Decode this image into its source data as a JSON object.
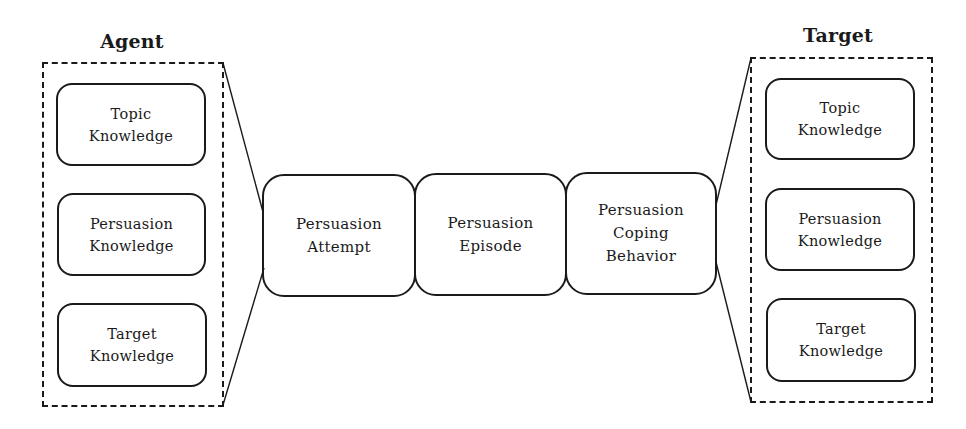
{
  "diagram": {
    "agent": {
      "title": "Agent",
      "items": [
        {
          "label": "Topic\nKnowledge"
        },
        {
          "label": "Persuasion\nKnowledge"
        },
        {
          "label": "Target\nKnowledge"
        }
      ]
    },
    "center": {
      "items": [
        {
          "label": "Persuasion\nAttempt"
        },
        {
          "label": "Persuasion\nEpisode"
        },
        {
          "label": "Persuasion\nCoping\nBehavior"
        }
      ]
    },
    "target": {
      "title": "Target",
      "items": [
        {
          "label": "Topic\nKnowledge"
        },
        {
          "label": "Persuasion\nKnowledge"
        },
        {
          "label": "Target\nKnowledge"
        }
      ]
    },
    "colors": {
      "stroke": "#1a1a1a",
      "background": "#ffffff"
    }
  }
}
